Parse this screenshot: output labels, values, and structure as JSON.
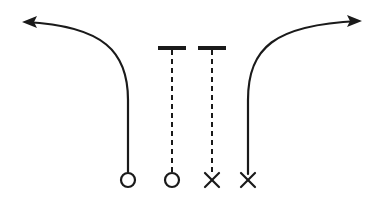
{
  "canvas": {
    "width": 382,
    "height": 197,
    "background": "#ffffff",
    "ink": "#1a1a1a",
    "title": "Play Diagram"
  },
  "chart_data": {
    "type": "diagram",
    "xlabel": "",
    "ylabel": "",
    "grid": false,
    "legend": false,
    "xlim": [
      0,
      382
    ],
    "ylim": [
      0,
      197
    ],
    "players": [
      {
        "id": "player-1",
        "marker": "circle",
        "marker_label": "O",
        "x": 128,
        "y": 180,
        "radius": 7,
        "route": "curl-out-left",
        "route_style": "solid",
        "route_end": "arrow",
        "route_direction": "left"
      },
      {
        "id": "player-2",
        "marker": "circle",
        "marker_label": "O",
        "x": 172,
        "y": 180,
        "radius": 7,
        "route": "vertical-stop",
        "route_style": "dashed",
        "route_end": "tee",
        "route_direction": "up"
      },
      {
        "id": "player-3",
        "marker": "cross",
        "marker_label": "X",
        "x": 212,
        "y": 180,
        "radius": 7,
        "route": "vertical-stop",
        "route_style": "dashed",
        "route_end": "tee",
        "route_direction": "up"
      },
      {
        "id": "player-4",
        "marker": "cross",
        "marker_label": "X",
        "x": 248,
        "y": 180,
        "radius": 7,
        "route": "curl-out-right",
        "route_style": "solid",
        "route_end": "arrow",
        "route_direction": "right"
      }
    ],
    "routes": [
      {
        "id": "route-left-solid",
        "from_player": "player-1",
        "style": "solid",
        "stroke_width": 2.2,
        "terminator": "arrowhead",
        "path": "M 128 172 L 128 100 C 128 52 104 26 26 22",
        "arrow_tip": {
          "x": 22,
          "y": 22
        },
        "arrow_angle_deg": 180
      },
      {
        "id": "route-inner-left-dashed",
        "from_player": "player-2",
        "style": "dashed",
        "stroke_width": 2.0,
        "dash_pattern": [
          5,
          4
        ],
        "terminator": "tee-bar",
        "path": "M 172 172 L 172 49",
        "tee": {
          "x1": 158,
          "x2": 186,
          "y": 48,
          "stroke_width": 4
        }
      },
      {
        "id": "route-inner-right-dashed",
        "from_player": "player-3",
        "style": "dashed",
        "stroke_width": 2.0,
        "dash_pattern": [
          5,
          4
        ],
        "terminator": "tee-bar",
        "path": "M 212 172 L 212 49",
        "tee": {
          "x1": 198,
          "x2": 226,
          "y": 48,
          "stroke_width": 4
        }
      },
      {
        "id": "route-right-solid",
        "from_player": "player-4",
        "style": "solid",
        "stroke_width": 2.2,
        "terminator": "arrowhead",
        "path": "M 248 174 L 248 100 C 248 48 274 25 358 21",
        "arrow_tip": {
          "x": 362,
          "y": 21
        },
        "arrow_angle_deg": 0
      }
    ],
    "arrowheads": [
      {
        "id": "arrowhead-left",
        "tip_x": 22,
        "tip_y": 22,
        "direction": "left",
        "length": 15,
        "half_width": 6
      },
      {
        "id": "arrowhead-right",
        "tip_x": 362,
        "tip_y": 21,
        "direction": "right",
        "length": 15,
        "half_width": 6
      }
    ]
  }
}
